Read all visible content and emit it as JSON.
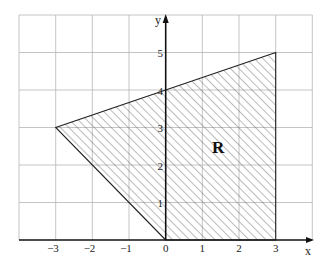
{
  "figure": {
    "x_axis_label": "x",
    "y_axis_label": "y",
    "region_label": "R",
    "x_ticks": [
      {
        "value": -3,
        "label": "−3"
      },
      {
        "value": -2,
        "label": "−2"
      },
      {
        "value": -1,
        "label": "−1"
      },
      {
        "value": 0,
        "label": "0"
      },
      {
        "value": 1,
        "label": "1"
      },
      {
        "value": 2,
        "label": "2"
      },
      {
        "value": 3,
        "label": "3"
      }
    ],
    "y_ticks": [
      {
        "value": 1,
        "label": "1"
      },
      {
        "value": 2,
        "label": "2"
      },
      {
        "value": 3,
        "label": "3"
      },
      {
        "value": 4,
        "label": "4"
      },
      {
        "value": 5,
        "label": "5"
      }
    ],
    "grid": {
      "xmin": -4,
      "xmax": 4,
      "ymin": 0,
      "ymax": 6
    },
    "region_vertices": [
      [
        0,
        0
      ],
      [
        -3,
        3
      ],
      [
        0,
        4
      ],
      [
        3,
        5
      ],
      [
        3,
        0
      ]
    ],
    "colors": {
      "grid": "#b0b0b0",
      "axis": "#111111",
      "hatch": "#555555"
    }
  }
}
